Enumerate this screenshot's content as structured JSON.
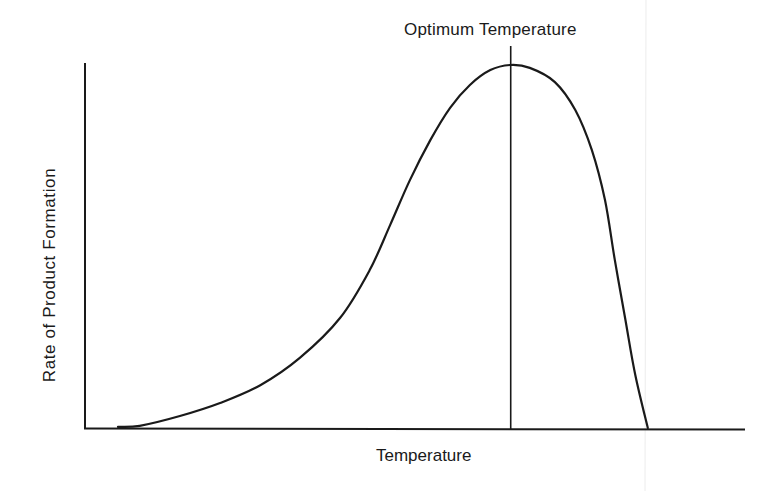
{
  "chart_data": {
    "type": "line",
    "title": "",
    "annotation": "Optimum Temperature",
    "xlabel": "Temperature",
    "ylabel": "Rate of Product Formation",
    "xlim": [
      0,
      100
    ],
    "ylim": [
      0,
      100
    ],
    "grid": false,
    "legend": null,
    "ticks": false,
    "optimum_x": 64.6,
    "series": [
      {
        "name": "Rate of Product Formation",
        "x": [
          5.0,
          8.3,
          14.4,
          20.5,
          26.6,
          32.6,
          38.7,
          43.2,
          46.3,
          49.3,
          52.4,
          55.4,
          58.4,
          61.5,
          64.5,
          67.5,
          71.3,
          74.4,
          76.9,
          78.9,
          80.4,
          82.0,
          83.5,
          85.4
        ],
        "values": [
          0.3,
          0.6,
          3.3,
          6.9,
          11.8,
          19.3,
          30.3,
          43.5,
          55.9,
          68.3,
          79.3,
          88.2,
          94.5,
          98.6,
          100.0,
          99.2,
          95.3,
          87.6,
          76.6,
          62.8,
          46.3,
          29.8,
          14.6,
          0.0
        ]
      }
    ]
  },
  "labels": {
    "optimum": "Optimum Temperature",
    "x_axis": "Temperature",
    "y_axis": "Rate of Product Formation"
  },
  "colors": {
    "line": "#1a1a1a",
    "background": "#ffffff",
    "faint_rule": "#e8e8e8"
  }
}
